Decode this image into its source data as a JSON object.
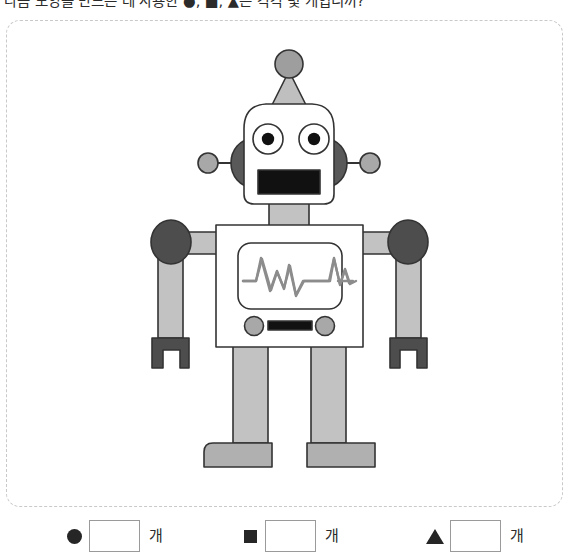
{
  "question": {
    "text": "다음 모양을 만드는 데 사용한 ●, ■, ▲은 각각 몇 개입니까?"
  },
  "figure": {
    "name": "robot-figure",
    "frame_style": "dashed",
    "parts": [
      {
        "name": "antenna-ball",
        "shape": "circle",
        "color": "#9e9e9e"
      },
      {
        "name": "antenna-cone",
        "shape": "triangle",
        "color": "#bfbfbf"
      },
      {
        "name": "head",
        "shape": "rounded-square",
        "color": "#ffffff"
      },
      {
        "name": "ear-left",
        "shape": "circle",
        "color": "#595959"
      },
      {
        "name": "ear-right",
        "shape": "circle",
        "color": "#595959"
      },
      {
        "name": "side-antenna-ball-left",
        "shape": "circle",
        "color": "#a8a8a8"
      },
      {
        "name": "side-antenna-ball-right",
        "shape": "circle",
        "color": "#a8a8a8"
      },
      {
        "name": "eye-left",
        "shape": "circle",
        "color": "#ffffff"
      },
      {
        "name": "eye-right",
        "shape": "circle",
        "color": "#ffffff"
      },
      {
        "name": "mouth",
        "shape": "rectangle",
        "color": "#111111"
      },
      {
        "name": "neck",
        "shape": "rectangle",
        "color": "#c2c2c2"
      },
      {
        "name": "body",
        "shape": "rectangle",
        "color": "#ffffff"
      },
      {
        "name": "screen",
        "shape": "rounded-rectangle",
        "color": "#ffffff"
      },
      {
        "name": "waveform",
        "shape": "polyline",
        "color": "#8c8c8c"
      },
      {
        "name": "shoulder-left",
        "shape": "circle",
        "color": "#4d4d4d"
      },
      {
        "name": "shoulder-right",
        "shape": "circle",
        "color": "#4d4d4d"
      },
      {
        "name": "arm-left",
        "shape": "rectangle",
        "color": "#c2c2c2"
      },
      {
        "name": "arm-right",
        "shape": "rectangle",
        "color": "#c2c2c2"
      },
      {
        "name": "hand-left",
        "shape": "claw",
        "color": "#4d4d4d"
      },
      {
        "name": "hand-right",
        "shape": "claw",
        "color": "#4d4d4d"
      },
      {
        "name": "button-left",
        "shape": "circle",
        "color": "#a8a8a8"
      },
      {
        "name": "button-right",
        "shape": "circle",
        "color": "#a8a8a8"
      },
      {
        "name": "control-bar",
        "shape": "rectangle",
        "color": "#111111"
      },
      {
        "name": "leg-left",
        "shape": "rectangle",
        "color": "#c2c2c2"
      },
      {
        "name": "leg-right",
        "shape": "rectangle",
        "color": "#c2c2c2"
      },
      {
        "name": "foot-left",
        "shape": "rectangle",
        "color": "#b0b0b0"
      },
      {
        "name": "foot-right",
        "shape": "rectangle",
        "color": "#b0b0b0"
      }
    ]
  },
  "answers": {
    "unit": "개",
    "groups": [
      {
        "symbol": "circle",
        "symbol_char": "●",
        "value": "",
        "placeholder": "",
        "unit": "개"
      },
      {
        "symbol": "square",
        "symbol_char": "■",
        "value": "",
        "placeholder": "",
        "unit": "개"
      },
      {
        "symbol": "triangle",
        "symbol_char": "▲",
        "value": "",
        "placeholder": "",
        "unit": "개"
      }
    ]
  },
  "colors": {
    "ink": "#2b2b2b",
    "outline": "#333333",
    "frame_dashed": "#c9c9c9",
    "light_gray": "#c2c2c2",
    "mid_gray": "#a8a8a8",
    "dark_gray": "#4d4d4d",
    "black_fill": "#111111"
  }
}
